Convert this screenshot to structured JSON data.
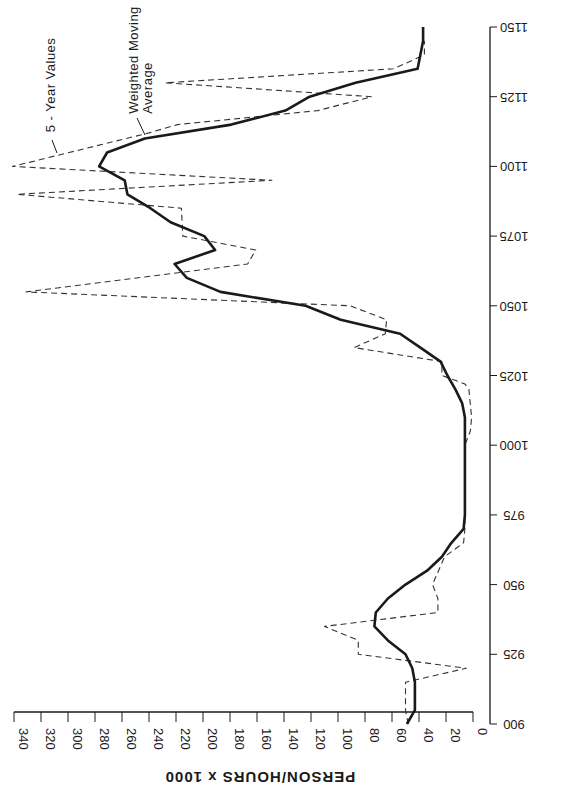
{
  "chart_data": {
    "type": "line",
    "orientation": "rotated-90-clockwise (years on vertical axis at right, values on horizontal axis at bottom)",
    "title": "",
    "xlabel": "",
    "ylabel": "PERSON/HOURS x 1000",
    "xlim": [
      900,
      1150
    ],
    "ylim": [
      0,
      340
    ],
    "grid": false,
    "x_ticks": [
      900,
      925,
      950,
      975,
      1000,
      1025,
      1050,
      1075,
      1100,
      1125,
      1150
    ],
    "x_tick_labels": [
      "900",
      "925",
      "950",
      "975",
      "1000",
      "1025",
      "1050",
      "1075",
      "1100",
      "1125",
      "1150"
    ],
    "y_ticks": [
      0,
      20,
      40,
      60,
      80,
      100,
      120,
      140,
      160,
      180,
      200,
      220,
      240,
      260,
      280,
      300,
      320,
      340
    ],
    "y_tick_labels": [
      "0",
      "20",
      "40",
      "60",
      "80",
      "100",
      "120",
      "140",
      "160",
      "180",
      "200",
      "220",
      "240",
      "260",
      "280",
      "300",
      "320",
      "340"
    ],
    "legend": "inline annotations at top-left",
    "annotations": [
      "5 - Year Values",
      "Weighted Moving Average"
    ],
    "series": [
      {
        "name": "5 - Year Values",
        "style": "dashed",
        "x": [
          900,
          905,
          915,
          920,
          925,
          930,
          935,
          940,
          945,
          950,
          960,
          965,
          970,
          1000,
          1005,
          1010,
          1020,
          1022,
          1025,
          1030,
          1035,
          1040,
          1045,
          1050,
          1055,
          1065,
          1070,
          1075,
          1085,
          1090,
          1095,
          1100,
          1112,
          1115,
          1120,
          1125,
          1130,
          1135,
          1140,
          1145
        ],
        "values": [
          48,
          50,
          50,
          5,
          85,
          85,
          110,
          26,
          26,
          30,
          21,
          7,
          6,
          6,
          2,
          1,
          3,
          6,
          23,
          23,
          88,
          65,
          64,
          91,
          331,
          167,
          161,
          215,
          216,
          338,
          149,
          341,
          240,
          219,
          115,
          75,
          228,
          59,
          36,
          36
        ]
      },
      {
        "name": "Weighted Moving Average",
        "style": "solid",
        "x": [
          900,
          905,
          915,
          920,
          925,
          930,
          935,
          940,
          945,
          950,
          955,
          960,
          965,
          970,
          975,
          1000,
          1010,
          1015,
          1020,
          1025,
          1030,
          1035,
          1040,
          1045,
          1050,
          1055,
          1060,
          1065,
          1070,
          1075,
          1080,
          1085,
          1090,
          1095,
          1100,
          1105,
          1110,
          1115,
          1120,
          1125,
          1130,
          1135,
          1145,
          1150
        ],
        "values": [
          49,
          43,
          43,
          45,
          50,
          63,
          73,
          72,
          63,
          50,
          34,
          23,
          16,
          7,
          6,
          6,
          6,
          8,
          13,
          19,
          24,
          39,
          54,
          98,
          124,
          187,
          212,
          221,
          191,
          199,
          224,
          239,
          256,
          258,
          277,
          271,
          243,
          179,
          139,
          121,
          87,
          41,
          37,
          37
        ]
      }
    ]
  },
  "labels": {
    "value_axis_title": "PERSON/HOURS x 1000",
    "annotation_five_year": "5 - Year Values",
    "annotation_wma_line1": "Weighted Moving",
    "annotation_wma_line2": "Average"
  },
  "colors": {
    "ink": "#1a1a1a",
    "dashed": "#333333",
    "background": "#ffffff"
  }
}
